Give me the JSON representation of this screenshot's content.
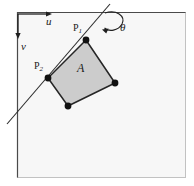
{
  "figure": {
    "frame": {
      "name": "image-frame",
      "x": 17,
      "y": 12,
      "width": 169,
      "height": 166,
      "fill": "#f7f7f7",
      "border_dark": "#3a3a3a",
      "border_light": "#b8b8b8"
    },
    "axes": {
      "u": {
        "label": "u",
        "direction": "right",
        "from_x": 18,
        "from_y": 14,
        "to_x": 52,
        "to_y": 14
      },
      "v": {
        "label": "v",
        "direction": "down",
        "from_x": 18,
        "from_y": 14,
        "to_x": 18,
        "to_y": 39
      }
    },
    "angle": {
      "label": "θ",
      "symbol_name": "theta",
      "arc_center_x": 110,
      "arc_center_y": 22,
      "arrow_tip_x": 103,
      "arrow_tip_y": 29
    },
    "line": {
      "name": "reference-line",
      "x1": 110,
      "y1": 4,
      "x2": 7,
      "y2": 124,
      "color": "#2b2b2b"
    },
    "region": {
      "label": "A",
      "fill": "#cccccc",
      "stroke": "#262626",
      "vertices": [
        {
          "name": "p1",
          "label": "P",
          "subscript": "1",
          "x": 86,
          "y": 40
        },
        {
          "name": "p-right",
          "label": "",
          "subscript": "",
          "x": 115,
          "y": 83
        },
        {
          "name": "p-bottom",
          "label": "",
          "subscript": "",
          "x": 68,
          "y": 106
        },
        {
          "name": "p2",
          "label": "P",
          "subscript": "2",
          "x": 48,
          "y": 78
        }
      ],
      "vertex_dot_radius": 3.4,
      "vertex_dot_color": "#111111"
    },
    "labels": {
      "u": "u",
      "v": "v",
      "theta": "θ",
      "area": "A",
      "p1_base": "P",
      "p1_sub": "1",
      "p2_base": "P",
      "p2_sub": "2"
    }
  }
}
